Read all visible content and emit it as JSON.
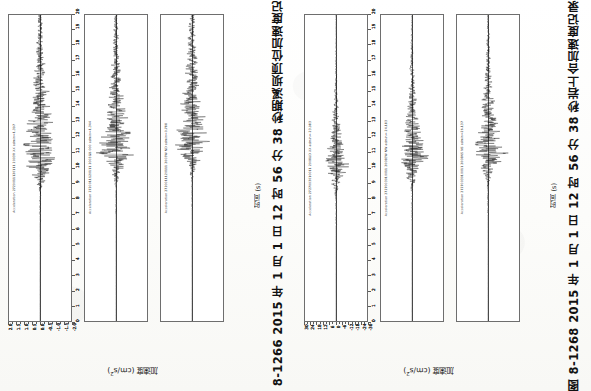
{
  "page": {
    "kind": "scanned-book-page-rotated",
    "rotation_note": "Page content is rotated 90 degrees counter-clockwise relative to the image frame."
  },
  "figures": [
    {
      "id": "fig-8-1266",
      "caption": "图 8-1266   2015 年 1 月 1 日 12 时 56 分 38 秒期溪坝顶位加速度记录",
      "number": "图 8-1266",
      "xlabel": "时间 (s)",
      "ylabel_text": "加速度 (cm/s",
      "ylabel_sup": "2",
      "ylabel_tail": ")",
      "panels": [
        {
          "label": "Acceleration 2720011120111 2003R XX admin=1.397",
          "amax": 1.397,
          "y_ticks": [
            "2.0",
            "1.5",
            "1.0",
            "0.5",
            "0.0",
            "-0.5",
            "-1.0",
            "-1.5",
            "-2.0"
          ],
          "seed": 11,
          "peak_time": 10.5,
          "peak_amp": 0.86,
          "decay": 0.17
        },
        {
          "label": "Acceleration 2720011120111 2003GB 000 admin=1.344",
          "amax": 1.344,
          "y_ticks": [
            "2.0",
            "1.5",
            "1.0",
            "0.5",
            "0.0",
            "-0.5",
            "-1.0",
            "-1.5",
            "-2.0"
          ],
          "seed": 27,
          "peak_time": 11.0,
          "peak_amp": 0.8,
          "decay": 0.19
        },
        {
          "label": "Acceleration 2720011120111 2003W ND admin=0.788",
          "amax": 0.788,
          "y_ticks": [
            "2.0",
            "1.5",
            "1.0",
            "0.5",
            "0.0",
            "-0.5",
            "-1.0",
            "-1.5",
            "-2.0"
          ],
          "seed": 43,
          "peak_time": 11.4,
          "peak_amp": 0.74,
          "decay": 0.16
        }
      ]
    },
    {
      "id": "fig-8-1268",
      "caption": "图 8-1268   2015 年 1 月 1 日 12 时 56 分 38 秒岩上合加速度记录",
      "number": "图 8-1268",
      "xlabel": "时间 (s)",
      "ylabel_text": "加速度 (cm/s",
      "ylabel_sup": "2",
      "ylabel_tail": ")",
      "panels": [
        {
          "label": "Acceleration 2727003010011 2008UD XX admin=-23.983",
          "amax": 23.983,
          "y_ticks": [
            "30",
            "24",
            "18",
            "12",
            "6",
            "0",
            "-6",
            "-12",
            "-18",
            "-24",
            "-30"
          ],
          "seed": 61,
          "peak_time": 10.2,
          "peak_amp": 0.62,
          "decay": 0.34
        },
        {
          "label": "Acceleration 2727003010011 2008EW NW admin=-24.183",
          "amax": 24.183,
          "y_ticks": [
            "30",
            "24",
            "18",
            "12",
            "6",
            "0",
            "-6",
            "-12",
            "-18",
            "-24",
            "-30"
          ],
          "seed": 83,
          "peak_time": 10.6,
          "peak_amp": 0.7,
          "decay": 0.26
        },
        {
          "label": "Acceleration 2727003010011 2008NS NS admin=26.137",
          "amax": 26.137,
          "y_ticks": [
            "30",
            "24",
            "18",
            "12",
            "6",
            "0",
            "-6",
            "-12",
            "-18",
            "-24",
            "-30"
          ],
          "seed": 97,
          "peak_time": 10.9,
          "peak_amp": 0.74,
          "decay": 0.24
        }
      ]
    }
  ],
  "time_axis": {
    "min": 0,
    "max": 20,
    "major_step": 1,
    "labels": [
      "0",
      "1",
      "2",
      "3",
      "4",
      "5",
      "6",
      "7",
      "8",
      "9",
      "10",
      "11",
      "12",
      "13",
      "14",
      "15",
      "16",
      "17",
      "18",
      "19",
      "20"
    ]
  },
  "chart_data": {
    "type": "line",
    "xlabel": "时间 (s)",
    "ylabel": "加速度 (cm/s2)",
    "xlim": [
      0,
      20
    ],
    "grid": false,
    "legend": "none",
    "orientation": "time axis drawn vertically (page rotated 90 deg)",
    "series": [
      {
        "name": "Fig 8-1266 / ch1 (XX)",
        "ylim": [
          -2.0,
          2.0
        ],
        "peak_abs": 1.397,
        "peak_time_s": 10.5
      },
      {
        "name": "Fig 8-1266 / ch2 (GB 000)",
        "ylim": [
          -2.0,
          2.0
        ],
        "peak_abs": 1.344,
        "peak_time_s": 11.0
      },
      {
        "name": "Fig 8-1266 / ch3 (W ND)",
        "ylim": [
          -2.0,
          2.0
        ],
        "peak_abs": 0.788,
        "peak_time_s": 11.4
      },
      {
        "name": "Fig 8-1268 / ch1 (UD XX)",
        "ylim": [
          -30,
          30
        ],
        "peak_abs": 23.983,
        "peak_time_s": 10.2
      },
      {
        "name": "Fig 8-1268 / ch2 (EW NW)",
        "ylim": [
          -30,
          30
        ],
        "peak_abs": 24.183,
        "peak_time_s": 10.6
      },
      {
        "name": "Fig 8-1268 / ch3 (NS NS)",
        "ylim": [
          -30,
          30
        ],
        "peak_abs": 26.137,
        "peak_time_s": 10.9
      }
    ]
  }
}
